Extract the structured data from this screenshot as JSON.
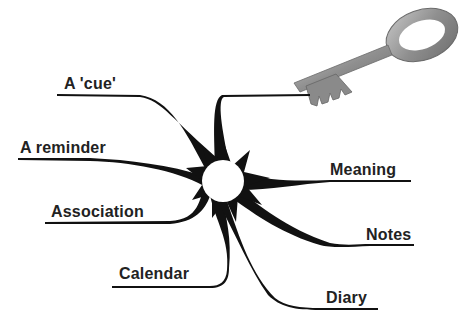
{
  "diagram": {
    "type": "mind-map",
    "central_node": {
      "shape": "white circle",
      "color": "#ffffff"
    },
    "branch_color": "#111111",
    "key_image": {
      "icon": "key-icon",
      "description": "old metal key",
      "color": "#9a9a9a"
    },
    "branches": [
      {
        "label": "A 'cue'",
        "side": "left"
      },
      {
        "label": "A reminder",
        "side": "left"
      },
      {
        "label": "Association",
        "side": "left"
      },
      {
        "label": "Calendar",
        "side": "left"
      },
      {
        "label": "Meaning",
        "side": "right"
      },
      {
        "label": "Notes",
        "side": "right"
      },
      {
        "label": "Diary",
        "side": "right"
      },
      {
        "label": "",
        "side": "top",
        "connects_to": "key-icon"
      }
    ]
  }
}
